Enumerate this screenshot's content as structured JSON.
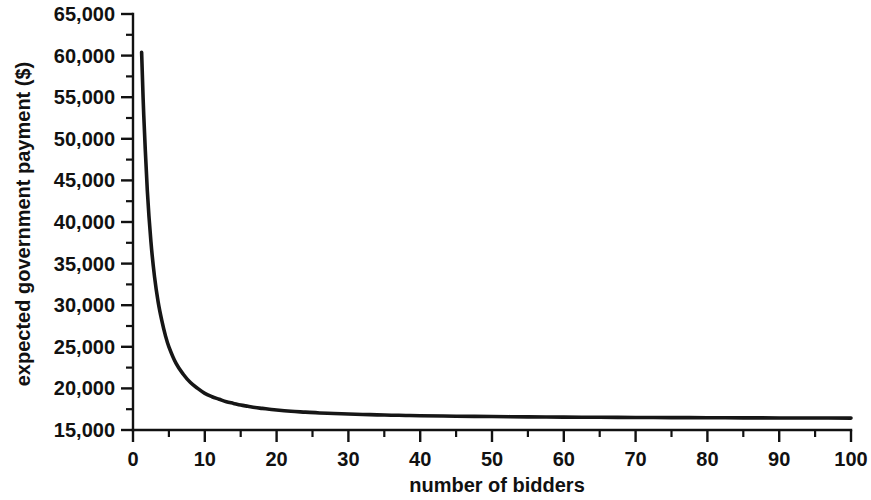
{
  "chart_data": {
    "type": "line",
    "title": "",
    "subtitle": "",
    "xlabel": "number of bidders",
    "ylabel": "expected government payment ($)",
    "xlim": [
      0,
      100
    ],
    "ylim": [
      15000,
      65000
    ],
    "grid": false,
    "legend": null,
    "legend_position": "none",
    "x_major_ticks": [
      0,
      10,
      20,
      30,
      40,
      50,
      60,
      70,
      80,
      90,
      100
    ],
    "x_minor_tick_interval": 5,
    "x_tick_labels": [
      "0",
      "10",
      "20",
      "30",
      "40",
      "50",
      "60",
      "70",
      "80",
      "90",
      "100"
    ],
    "y_major_ticks": [
      15000,
      20000,
      25000,
      30000,
      35000,
      40000,
      45000,
      50000,
      55000,
      60000,
      65000
    ],
    "y_minor_tick_interval": 2500,
    "y_tick_labels": [
      "15,000",
      "20,000",
      "25,000",
      "30,000",
      "35,000",
      "40,000",
      "45,000",
      "50,000",
      "55,000",
      "60,000",
      "65,000"
    ],
    "series": [
      {
        "name": "expected government payment",
        "color": "#161616",
        "x": [
          1.2,
          1.5,
          2,
          2.5,
          3,
          3.5,
          4,
          4.5,
          5,
          6,
          7,
          8,
          9,
          10,
          11,
          12,
          13,
          14,
          15,
          16,
          17,
          18,
          19,
          20,
          22,
          24,
          26,
          28,
          30,
          32,
          34,
          36,
          38,
          40,
          45,
          50,
          55,
          60,
          65,
          70,
          75,
          80,
          85,
          90,
          95,
          100
        ],
        "y": [
          60400,
          52800,
          43700,
          37600,
          33400,
          30400,
          28200,
          26400,
          25000,
          23000,
          21700,
          20700,
          20000,
          19400,
          19000,
          18700,
          18400,
          18200,
          18000,
          17850,
          17700,
          17600,
          17500,
          17400,
          17250,
          17150,
          17050,
          16980,
          16920,
          16870,
          16820,
          16780,
          16750,
          16720,
          16660,
          16620,
          16580,
          16550,
          16530,
          16510,
          16490,
          16480,
          16460,
          16450,
          16440,
          16430
        ]
      }
    ],
    "annotations": []
  },
  "axes": {
    "x_title": "number of bidders",
    "y_title": "expected government payment ($)"
  }
}
